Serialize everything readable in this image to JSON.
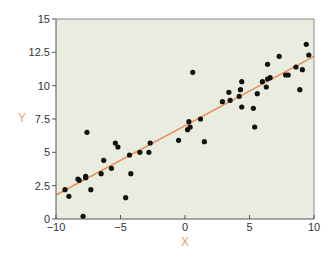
{
  "chart_data": {
    "type": "scatter",
    "title": "",
    "xlabel": "X",
    "ylabel": "Y",
    "xlim": [
      -10,
      10
    ],
    "ylim": [
      0,
      15
    ],
    "xticks": [
      "−10",
      "−5",
      "0",
      "5",
      "10"
    ],
    "yticks": [
      "0",
      "2.5",
      "5",
      "7.5",
      "10",
      "12.5",
      "15"
    ],
    "grid": false,
    "legend": null,
    "colors": {
      "plot_bg": "#e9eddf",
      "points": "#111111",
      "fit_line": "#e8905a",
      "axis_label": "#e8a070"
    },
    "series": [
      {
        "name": "data",
        "points": [
          [
            -9.3,
            2.2
          ],
          [
            -9.0,
            1.7
          ],
          [
            -7.6,
            6.5
          ],
          [
            -8.3,
            3.0
          ],
          [
            -8.2,
            2.9
          ],
          [
            -7.7,
            3.2
          ],
          [
            -7.7,
            3.1
          ],
          [
            -7.3,
            2.2
          ],
          [
            -7.9,
            0.2
          ],
          [
            -6.3,
            4.4
          ],
          [
            -6.5,
            3.4
          ],
          [
            -5.7,
            3.8
          ],
          [
            -5.4,
            5.7
          ],
          [
            -5.2,
            5.4
          ],
          [
            -2.7,
            5.7
          ],
          [
            -3.5,
            5.0
          ],
          [
            -2.8,
            5.0
          ],
          [
            -4.2,
            3.4
          ],
          [
            -4.3,
            4.8
          ],
          [
            -4.6,
            1.6
          ],
          [
            -0.5,
            5.9
          ],
          [
            0.2,
            6.7
          ],
          [
            0.3,
            7.3
          ],
          [
            0.6,
            11.0
          ],
          [
            1.2,
            7.5
          ],
          [
            1.5,
            5.8
          ],
          [
            0.4,
            6.9
          ],
          [
            2.9,
            8.8
          ],
          [
            3.4,
            9.5
          ],
          [
            3.5,
            8.9
          ],
          [
            4.2,
            9.2
          ],
          [
            4.4,
            10.3
          ],
          [
            4.3,
            9.7
          ],
          [
            4.4,
            8.4
          ],
          [
            5.3,
            8.3
          ],
          [
            5.4,
            6.9
          ],
          [
            5.6,
            9.4
          ],
          [
            6.0,
            10.3
          ],
          [
            6.3,
            9.9
          ],
          [
            6.4,
            10.5
          ],
          [
            6.6,
            10.6
          ],
          [
            6.4,
            11.6
          ],
          [
            7.3,
            12.2
          ],
          [
            7.8,
            10.8
          ],
          [
            8.0,
            10.8
          ],
          [
            8.6,
            11.4
          ],
          [
            8.9,
            9.7
          ],
          [
            9.1,
            11.2
          ],
          [
            9.4,
            13.1
          ],
          [
            9.6,
            12.3
          ]
        ]
      }
    ],
    "fit_line": {
      "x": [
        -10,
        10
      ],
      "y": [
        1.8,
        12.2
      ]
    }
  }
}
